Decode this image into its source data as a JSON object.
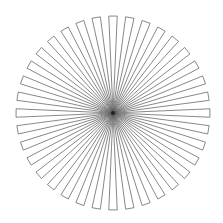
{
  "figure": {
    "title": "",
    "type": "radial-wedge-star",
    "wedge_count": 36,
    "center": [
      113,
      113
    ],
    "radius": 97,
    "wedge_fraction": 0.5,
    "stroke_color": "#555555",
    "fill_color": "#ffffff",
    "background": "#ffffff"
  }
}
